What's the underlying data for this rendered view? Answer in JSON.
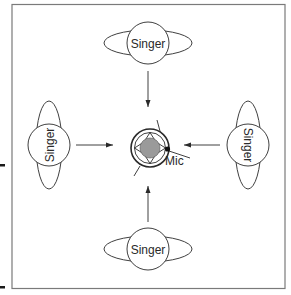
{
  "diagram": {
    "type": "microphone-placement",
    "singers": [
      {
        "id": "top",
        "label": "Singer"
      },
      {
        "id": "left",
        "label": "Singer"
      },
      {
        "id": "right",
        "label": "Singer"
      },
      {
        "id": "bottom",
        "label": "Singer"
      }
    ],
    "mic": {
      "label": "Mic"
    },
    "colors": {
      "stroke": "#2a2a2a",
      "frame": "#7a7a7a",
      "mic_fill": "#9a9a9a",
      "background": "#ffffff"
    }
  }
}
